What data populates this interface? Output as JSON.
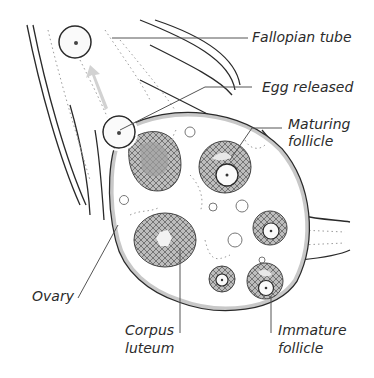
{
  "figure": {
    "labels": {
      "fallopian_tube": "Fallopian tube",
      "egg_released": "Egg released",
      "maturing_follicle_line1": "Maturing",
      "maturing_follicle_line2": "follicle",
      "ovary": "Ovary",
      "corpus_luteum_line1": "Corpus",
      "corpus_luteum_line2": "luteum",
      "immature_follicle_line1": "Immature",
      "immature_follicle_line2": "follicle"
    },
    "colors": {
      "line": "#2a2a2a",
      "leader": "#555555",
      "ovary_wall": "#c8c8c8",
      "follicle_fill": "#a9a9a9",
      "arrow": "#cfcfcf",
      "background": "#ffffff"
    }
  }
}
